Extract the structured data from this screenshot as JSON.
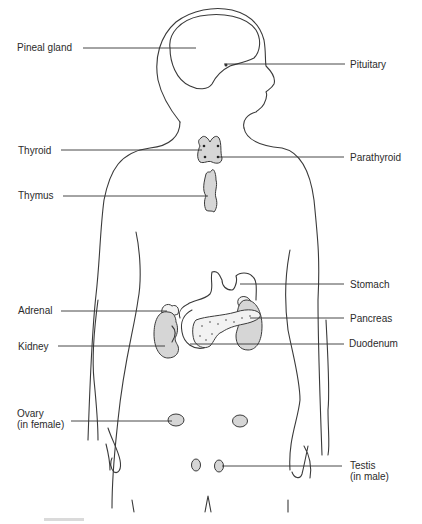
{
  "diagram": {
    "labels": {
      "pineal_gland": "Pineal gland",
      "pituitary": "Pituitary",
      "thyroid": "Thyroid",
      "parathyroid": "Parathyroid",
      "thymus": "Thymus",
      "stomach": "Stomach",
      "adrenal": "Adrenal",
      "pancreas": "Pancreas",
      "kidney": "Kidney",
      "duodenum": "Duodenum",
      "ovary": "Ovary\n(in female)",
      "testis": "Testis\n(in male)"
    },
    "colors": {
      "line": "#3a3a3a",
      "organ_fill": "#d6d6d6",
      "background": "#ffffff"
    }
  }
}
